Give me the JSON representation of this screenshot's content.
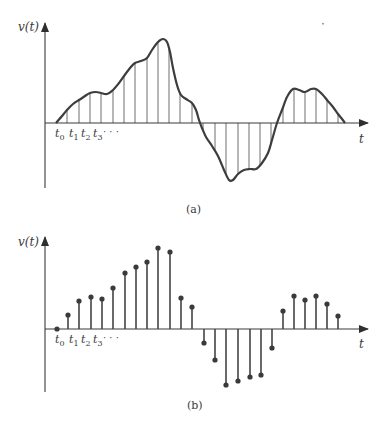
{
  "colors": {
    "ink": "#3a3a3a",
    "curve": "#3d3d3d",
    "thin": "#4a4a4a",
    "background": "#ffffff"
  },
  "panel_a": {
    "caption": "(a)",
    "y_axis_label": "v(t)",
    "x_axis_label": "t",
    "tick_labels": [
      {
        "base": "t",
        "sub": "0"
      },
      {
        "base": "t",
        "sub": "1"
      },
      {
        "base": "t",
        "sub": "2"
      },
      {
        "base": "t",
        "sub": "3"
      }
    ],
    "ellipsis": "· · ·",
    "axis": {
      "x0": 45,
      "y_axis_top": 23,
      "y_axis_bottom": 188,
      "baseline": 123,
      "x_end": 368
    },
    "curve_points": [
      [
        56,
        123
      ],
      [
        62,
        116
      ],
      [
        67,
        110
      ],
      [
        73,
        104
      ],
      [
        79,
        100
      ],
      [
        85,
        96
      ],
      [
        90,
        93
      ],
      [
        96,
        92
      ],
      [
        101,
        93
      ],
      [
        107,
        94
      ],
      [
        113,
        90
      ],
      [
        119,
        83
      ],
      [
        124,
        76
      ],
      [
        130,
        68
      ],
      [
        135,
        63
      ],
      [
        141,
        61
      ],
      [
        147,
        58
      ],
      [
        152,
        50
      ],
      [
        158,
        42
      ],
      [
        163,
        39
      ],
      [
        167,
        42
      ],
      [
        170,
        52
      ],
      [
        173,
        68
      ],
      [
        177,
        85
      ],
      [
        181,
        95
      ],
      [
        186,
        99
      ],
      [
        192,
        103
      ],
      [
        196,
        110
      ],
      [
        199,
        120
      ],
      [
        202,
        128
      ],
      [
        206,
        137
      ],
      [
        212,
        146
      ],
      [
        218,
        156
      ],
      [
        224,
        170
      ],
      [
        229,
        180
      ],
      [
        233,
        180
      ],
      [
        238,
        174
      ],
      [
        244,
        170
      ],
      [
        250,
        169
      ],
      [
        256,
        169
      ],
      [
        262,
        163
      ],
      [
        268,
        153
      ],
      [
        272,
        140
      ],
      [
        277,
        123
      ],
      [
        282,
        110
      ],
      [
        287,
        97
      ],
      [
        293,
        89
      ],
      [
        299,
        90
      ],
      [
        305,
        92
      ],
      [
        311,
        89
      ],
      [
        316,
        89
      ],
      [
        322,
        94
      ],
      [
        327,
        100
      ],
      [
        333,
        107
      ],
      [
        338,
        114
      ],
      [
        342,
        119
      ],
      [
        345,
        123
      ]
    ],
    "sample_x": [
      67,
      79,
      90,
      101,
      113,
      124,
      135,
      147,
      158,
      169,
      180,
      192,
      203,
      215,
      226,
      238,
      249,
      260,
      271,
      283,
      294,
      305,
      316,
      327,
      338
    ]
  },
  "panel_b": {
    "caption": "(b)",
    "y_axis_label": "v(t)",
    "x_axis_label": "t",
    "tick_labels": [
      {
        "base": "t",
        "sub": "0"
      },
      {
        "base": "t",
        "sub": "1"
      },
      {
        "base": "t",
        "sub": "2"
      },
      {
        "base": "t",
        "sub": "3"
      }
    ],
    "ellipsis": "· · ·",
    "axis": {
      "x0": 45,
      "y_axis_top": 237,
      "y_axis_bottom": 392,
      "baseline": 329,
      "x_end": 368
    },
    "stems": [
      [
        57,
        329
      ],
      [
        68,
        315
      ],
      [
        79,
        301
      ],
      [
        91,
        297
      ],
      [
        102,
        299
      ],
      [
        113,
        288
      ],
      [
        125,
        273
      ],
      [
        136,
        267
      ],
      [
        147,
        262
      ],
      [
        158,
        248
      ],
      [
        170,
        252
      ],
      [
        181,
        298
      ],
      [
        192,
        307
      ],
      [
        204,
        343
      ],
      [
        215,
        360
      ],
      [
        226,
        385
      ],
      [
        238,
        381
      ],
      [
        250,
        377
      ],
      [
        261,
        375
      ],
      [
        272,
        348
      ],
      [
        283,
        311
      ],
      [
        294,
        296
      ],
      [
        305,
        300
      ],
      [
        316,
        296
      ],
      [
        327,
        304
      ],
      [
        338,
        316
      ]
    ]
  },
  "chart_data": [
    {
      "type": "line",
      "title": "(a) Continuous-time signal v(t) with sampling instants",
      "xlabel": "t",
      "ylabel": "v(t)",
      "x_tick_labels": [
        "t0",
        "t1",
        "t2",
        "t3",
        "..."
      ],
      "note": "Smooth analog waveform; vertical lines mark sample instants t0, t1, t2, ...",
      "grid": false
    },
    {
      "type": "stem",
      "title": "(b) Sampled signal",
      "xlabel": "t",
      "ylabel": "v(t)",
      "x_tick_labels": [
        "t0",
        "t1",
        "t2",
        "t3",
        "..."
      ],
      "sample_index": [
        0,
        1,
        2,
        3,
        4,
        5,
        6,
        7,
        8,
        9,
        10,
        11,
        12,
        13,
        14,
        15,
        16,
        17,
        18,
        19,
        20,
        21,
        22,
        23,
        24,
        25
      ],
      "values_relative": [
        0,
        0.17,
        0.34,
        0.39,
        0.37,
        0.5,
        0.68,
        0.76,
        0.82,
        0.99,
        0.94,
        0.38,
        0.27,
        -0.17,
        -0.38,
        -0.68,
        -0.63,
        -0.58,
        -0.56,
        -0.23,
        0.22,
        0.4,
        0.35,
        0.4,
        0.3,
        0.16
      ],
      "grid": false
    }
  ]
}
